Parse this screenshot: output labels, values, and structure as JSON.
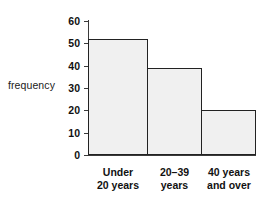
{
  "chart_data": {
    "type": "bar",
    "title": "",
    "subtitle": "",
    "xlabel": "",
    "ylabel": "frequency",
    "categories": [
      "Under 20 years",
      "20–39 years",
      "40 years and over"
    ],
    "category_lines": [
      [
        "Under",
        "20 years"
      ],
      [
        "20–39",
        "years"
      ],
      [
        "40 years",
        "and over"
      ]
    ],
    "values": [
      52,
      39,
      20
    ],
    "ylim": [
      0,
      60
    ],
    "ytick_labels": [
      "0",
      "10",
      "20",
      "30",
      "40",
      "50",
      "60"
    ],
    "ytick_values": [
      0,
      10,
      20,
      30,
      40,
      50,
      60
    ],
    "grid": false,
    "legend": null,
    "bar_style": "adjacent-histogram",
    "colors": {
      "bar_fill": "#f0f0f0",
      "bar_border": "#222222",
      "axis": "#3a3a3a",
      "text": "#111111",
      "background": "#ffffff"
    }
  }
}
